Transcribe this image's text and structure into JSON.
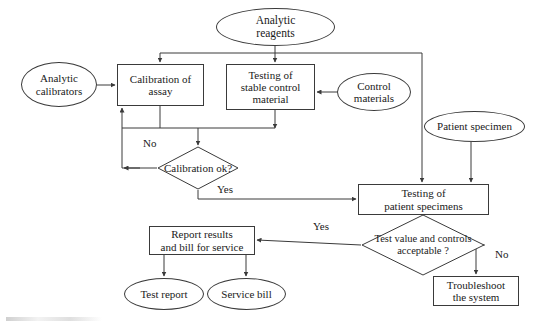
{
  "diagram": {
    "stroke_color": "#3a3a3a",
    "text_color": "#1a1a1a",
    "background_color": "#ffffff"
  },
  "nodes": {
    "analytic_reagents": {
      "label": "Analytic\nreagents",
      "shape": "ellipse",
      "x": 216,
      "y": 8,
      "w": 119,
      "h": 38,
      "font_size": 11.5
    },
    "analytic_calibrators": {
      "label": "Analytic\ncalibrators",
      "shape": "ellipse",
      "x": 21,
      "y": 62,
      "w": 76,
      "h": 45,
      "font_size": 11
    },
    "calibration_of_assay": {
      "label": "Calibration of\nassay",
      "shape": "box",
      "x": 117,
      "y": 64,
      "w": 87,
      "h": 42,
      "font_size": 11
    },
    "testing_stable_control_material": {
      "label": "Testing of\nstable control\nmaterial",
      "shape": "box",
      "x": 226,
      "y": 64,
      "w": 89,
      "h": 46,
      "font_size": 11
    },
    "control_materials": {
      "label": "Control\nmaterials",
      "shape": "ellipse",
      "x": 337,
      "y": 73,
      "w": 74,
      "h": 38,
      "font_size": 11
    },
    "patient_specimen": {
      "label": "Patient specimen",
      "shape": "ellipse",
      "x": 424,
      "y": 111,
      "w": 101,
      "h": 31,
      "font_size": 11
    },
    "calibration_ok": {
      "label": "Calibration\nok?",
      "shape": "diamond",
      "x": 157,
      "y": 146,
      "w": 82,
      "h": 44,
      "font_size": 11
    },
    "testing_patient_specimens": {
      "label": "Testing of\npatient specimens",
      "shape": "box",
      "x": 358,
      "y": 184,
      "w": 131,
      "h": 31,
      "font_size": 11
    },
    "test_value_controls_acceptable": {
      "label": "Test value\nand controls\nacceptable\n?",
      "shape": "diamond",
      "x": 361,
      "y": 214,
      "w": 124,
      "h": 62,
      "font_size": 10.5
    },
    "report_results": {
      "label": "Report results\nand bill for service",
      "shape": "box",
      "x": 149,
      "y": 226,
      "w": 106,
      "h": 29,
      "font_size": 11
    },
    "troubleshoot_system": {
      "label": "Troubleshoot\nthe system",
      "shape": "box",
      "x": 433,
      "y": 276,
      "w": 86,
      "h": 30,
      "font_size": 11
    },
    "test_report": {
      "label": "Test report",
      "shape": "ellipse",
      "x": 124,
      "y": 278,
      "w": 80,
      "h": 32,
      "font_size": 11
    },
    "service_bill": {
      "label": "Service bill",
      "shape": "ellipse",
      "x": 207,
      "y": 278,
      "w": 79,
      "h": 32,
      "font_size": 11
    }
  },
  "edge_labels": {
    "calibration_no": {
      "text": "No",
      "x": 143,
      "y": 137
    },
    "calibration_yes": {
      "text": "Yes",
      "x": 217,
      "y": 183
    },
    "acceptable_yes": {
      "text": "Yes",
      "x": 313,
      "y": 220
    },
    "acceptable_no": {
      "text": "No",
      "x": 495,
      "y": 248
    }
  },
  "edges": [
    {
      "name": "reagents-to-bus",
      "from": "analytic_reagents",
      "to": "distribution-bus"
    },
    {
      "name": "bus-to-calibration",
      "from": "distribution-bus",
      "to": "calibration_of_assay"
    },
    {
      "name": "bus-to-stable-control",
      "from": "distribution-bus",
      "to": "testing_stable_control_material"
    },
    {
      "name": "bus-to-patient-testing",
      "from": "distribution-bus",
      "to": "testing_patient_specimens"
    },
    {
      "name": "calibrators-to-calibration",
      "from": "analytic_calibrators",
      "to": "calibration_of_assay"
    },
    {
      "name": "control-materials-to-stable-control",
      "from": "control_materials",
      "to": "testing_stable_control_material"
    },
    {
      "name": "calibration-to-decision",
      "from": "calibration_of_assay",
      "to": "calibration_ok"
    },
    {
      "name": "stable-control-to-decision",
      "from": "testing_stable_control_material",
      "to": "calibration_ok"
    },
    {
      "name": "decision-no-loop",
      "from": "calibration_ok",
      "to": "calibration_of_assay",
      "label": "No"
    },
    {
      "name": "decision-yes-to-patient-testing",
      "from": "calibration_ok",
      "to": "testing_patient_specimens",
      "label": "Yes"
    },
    {
      "name": "patient-specimen-to-testing",
      "from": "patient_specimen",
      "to": "testing_patient_specimens"
    },
    {
      "name": "patient-testing-to-acceptable",
      "from": "testing_patient_specimens",
      "to": "test_value_controls_acceptable"
    },
    {
      "name": "acceptable-yes-to-report",
      "from": "test_value_controls_acceptable",
      "to": "report_results",
      "label": "Yes"
    },
    {
      "name": "acceptable-no-to-troubleshoot",
      "from": "test_value_controls_acceptable",
      "to": "troubleshoot_system",
      "label": "No"
    },
    {
      "name": "report-to-test-report",
      "from": "report_results",
      "to": "test_report"
    },
    {
      "name": "report-to-service-bill",
      "from": "report_results",
      "to": "service_bill"
    }
  ]
}
